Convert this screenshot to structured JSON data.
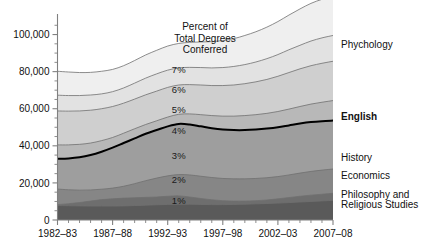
{
  "chart": {
    "title_lines": [
      "Percent of",
      "Total Degrees",
      "Conferred"
    ],
    "xlabel": "",
    "ylabel": ""
  },
  "axes": {
    "y_ticks": [
      "0",
      "20,000",
      "40,000",
      "60,000",
      "80,000",
      "100,000"
    ],
    "y_tick_values": [
      0,
      20000,
      40000,
      60000,
      80000,
      100000
    ],
    "y_minor_step": 5000,
    "ylim": [
      0,
      110000
    ],
    "x_ticks": [
      "1982–83",
      "1987–88",
      "1992–93",
      "1997–98",
      "2002–03",
      "2007–08"
    ],
    "x_tick_values": [
      1982,
      1987,
      1992,
      1997,
      2002,
      2007
    ],
    "xlim": [
      1982,
      2007
    ],
    "x_minor_step": 1,
    "grid": false
  },
  "percent_labels": [
    {
      "text": "7%",
      "x": 1993.0,
      "y": 79000
    },
    {
      "text": "6%",
      "x": 1993.0,
      "y": 68500
    },
    {
      "text": "5%",
      "x": 1993.0,
      "y": 57500
    },
    {
      "text": "4%",
      "x": 1993.0,
      "y": 46500
    },
    {
      "text": "3%",
      "x": 1993.0,
      "y": 33000
    },
    {
      "text": "2%",
      "x": 1993.0,
      "y": 20000
    },
    {
      "text": "1%",
      "x": 1993.0,
      "y": 8500
    }
  ],
  "series_labels": [
    {
      "name": "Phychology",
      "y": 48,
      "bold": false
    },
    {
      "name": "English",
      "y": 120,
      "bold": true
    },
    {
      "name": "History",
      "y": 161,
      "bold": false
    },
    {
      "name": "Economics",
      "y": 179,
      "bold": false
    },
    {
      "name": "Philosophy and",
      "y": 198,
      "bold": false
    },
    {
      "name": "Religious Studies",
      "y": 208,
      "bold": false
    }
  ],
  "colors": {
    "band_1": "#5a5a5a",
    "band_2": "#6e6e6e",
    "band_3": "#868686",
    "band_4": "#9e9e9e",
    "band_5": "#b8b8b8",
    "band_6": "#cfcfcf",
    "band_7": "#e2e2e2",
    "band_8": "#efefef",
    "edge": "#707070",
    "highlight": "#000000",
    "axis": "#808080",
    "text": "#111111"
  },
  "chart_data": {
    "type": "area",
    "xlabel": "",
    "ylabel": "",
    "ylim": [
      0,
      110000
    ],
    "xlim": [
      1982,
      2007
    ],
    "grid": false,
    "stacked": true,
    "note": "Stacked area chart of bachelor's degrees conferred by selected fields; bands are cumulative totals. Percent contours (1%-7% of total degrees conferred) are overlaid. The bold contour is the 4%-5% highlight passing through English.",
    "x": [
      1982,
      1983,
      1984,
      1985,
      1986,
      1987,
      1988,
      1989,
      1990,
      1991,
      1992,
      1993,
      1994,
      1995,
      1996,
      1997,
      1998,
      1999,
      2000,
      2001,
      2002,
      2003,
      2004,
      2005,
      2006,
      2007
    ],
    "x_labels": [
      "1982–83",
      "1987–88",
      "1992–93",
      "1997–98",
      "2002–03",
      "2007–08"
    ],
    "legend_position": "right",
    "series": [
      {
        "name": "Philosophy and Religious Studies",
        "color": "#5a5a5a",
        "values": [
          7800,
          7700,
          7600,
          7500,
          7500,
          7500,
          7600,
          7800,
          8000,
          8200,
          8400,
          8500,
          8500,
          8400,
          8300,
          8300,
          8400,
          8500,
          8700,
          8900,
          9100,
          9400,
          9700,
          10000,
          10300,
          10600
        ]
      },
      {
        "name": "Economics",
        "color": "#6e6e6e",
        "values": [
          8300,
          8800,
          9400,
          10200,
          11000,
          11400,
          11800,
          12000,
          12200,
          12400,
          12800,
          13000,
          12400,
          11600,
          10900,
          10400,
          10200,
          10200,
          10400,
          10800,
          11400,
          12100,
          12800,
          13400,
          13900,
          14400
        ]
      },
      {
        "name": "History",
        "color": "#868686",
        "values": [
          16700,
          16300,
          16100,
          16200,
          16600,
          17200,
          18200,
          19600,
          21200,
          22600,
          23800,
          24500,
          24300,
          23600,
          22900,
          22400,
          22200,
          22200,
          22400,
          22800,
          23400,
          24300,
          25300,
          26200,
          26900,
          27500
        ]
      },
      {
        "name": "English",
        "color": "#9e9e9e",
        "values": [
          33000,
          33200,
          33800,
          35000,
          36800,
          39000,
          41500,
          44000,
          46500,
          48500,
          50500,
          51800,
          51500,
          50500,
          49500,
          48800,
          48500,
          48500,
          48800,
          49300,
          50000,
          51000,
          52000,
          52800,
          53300,
          53600
        ]
      },
      {
        "name": "Mid band A",
        "color": "#b8b8b8",
        "values": [
          40500,
          40500,
          40800,
          41500,
          42800,
          44500,
          46800,
          49200,
          51500,
          53500,
          55500,
          57000,
          57200,
          56800,
          56300,
          56000,
          56000,
          56300,
          56800,
          57500,
          58500,
          59800,
          61200,
          62500,
          63500,
          64400
        ]
      },
      {
        "name": "Mid band B",
        "color": "#cfcfcf",
        "values": [
          58800,
          58700,
          58800,
          59200,
          60000,
          61200,
          63000,
          65200,
          67500,
          69500,
          71500,
          72800,
          73000,
          72800,
          72500,
          72500,
          72800,
          73500,
          74500,
          75800,
          77500,
          79500,
          81500,
          83200,
          84500,
          85600
        ]
      },
      {
        "name": "Mid band C",
        "color": "#e2e2e2",
        "values": [
          67300,
          67100,
          67100,
          67400,
          68000,
          69200,
          71200,
          73800,
          76500,
          78800,
          80800,
          82000,
          82300,
          82200,
          82000,
          82200,
          82800,
          83800,
          85200,
          87000,
          89200,
          91800,
          94200,
          96500,
          98200,
          99500
        ]
      },
      {
        "name": "Phychology",
        "color": "#efefef",
        "values": [
          80200,
          79800,
          79500,
          79600,
          80200,
          81200,
          83200,
          86000,
          89000,
          91500,
          93800,
          95200,
          95800,
          96000,
          96200,
          96800,
          97800,
          99500,
          101500,
          104000,
          107000,
          110500,
          113800,
          116800,
          119000,
          120500
        ]
      }
    ],
    "highlight_series": "English",
    "percent_contours": [
      "1%",
      "2%",
      "3%",
      "4%",
      "5%",
      "6%",
      "7%"
    ]
  }
}
